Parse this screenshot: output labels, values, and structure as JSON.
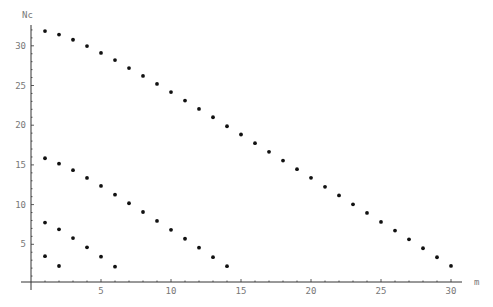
{
  "chart_data": {
    "type": "scatter",
    "title": "",
    "xlabel": "m",
    "ylabel": "Nc",
    "xlim": [
      0,
      31
    ],
    "ylim": [
      0,
      33
    ],
    "grid": false,
    "legend": null,
    "x_ticks": [
      5,
      10,
      15,
      20,
      25,
      30
    ],
    "y_ticks": [
      5,
      10,
      15,
      20,
      25,
      30
    ],
    "x_tick_labels": [
      "5",
      "10",
      "15",
      "20",
      "25",
      "30"
    ],
    "y_tick_labels": [
      "5",
      "10",
      "15",
      "20",
      "25",
      "30"
    ],
    "series": [
      {
        "name": "series-1",
        "x": [
          1,
          2,
          3,
          4,
          5,
          6,
          7,
          8,
          9,
          10,
          11,
          12,
          13,
          14,
          15,
          16,
          17,
          18,
          19,
          20,
          21,
          22,
          23,
          24,
          25,
          26,
          27,
          28,
          29,
          30
        ],
        "values": [
          31.85,
          31.42,
          30.76,
          29.96,
          29.1,
          28.2,
          27.2,
          26.2,
          25.2,
          24.17,
          23.1,
          22.05,
          21.0,
          19.87,
          18.83,
          17.74,
          16.65,
          15.55,
          14.46,
          13.37,
          12.24,
          11.15,
          10.04,
          8.95,
          7.82,
          6.73,
          5.63,
          4.5,
          3.37,
          2.28
        ]
      },
      {
        "name": "series-2",
        "x": [
          1,
          2,
          3,
          4,
          5,
          6,
          7,
          8,
          9,
          10,
          11,
          12,
          13,
          14
        ],
        "values": [
          15.84,
          15.16,
          14.33,
          13.36,
          12.35,
          11.25,
          10.17,
          9.07,
          7.95,
          6.82,
          5.7,
          4.57,
          3.38,
          2.25
        ]
      },
      {
        "name": "series-3",
        "x": [
          1,
          2,
          3,
          4,
          5,
          6
        ],
        "values": [
          7.73,
          6.89,
          5.79,
          4.62,
          3.44,
          2.18
        ]
      },
      {
        "name": "series-4",
        "x": [
          1,
          2
        ],
        "values": [
          3.5,
          2.27
        ]
      }
    ]
  },
  "axes": {
    "x_label": "m",
    "y_label": "Nc"
  }
}
